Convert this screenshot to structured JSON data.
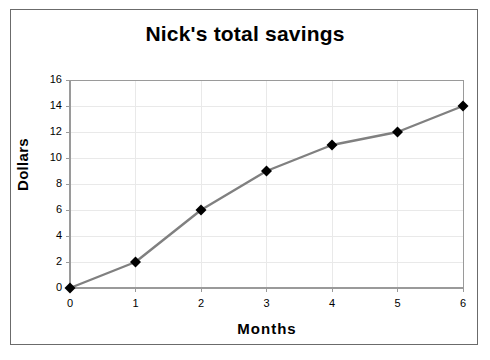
{
  "chart_data": {
    "type": "line",
    "title": "Nick's total savings",
    "xlabel": "Months",
    "ylabel": "Dollars",
    "x": [
      0,
      1,
      2,
      3,
      4,
      5,
      6
    ],
    "values": [
      0,
      2,
      6,
      9,
      11,
      12,
      14
    ],
    "series": [
      {
        "name": "Nick's total savings",
        "values": [
          0,
          2,
          6,
          9,
          11,
          12,
          14
        ]
      }
    ],
    "xlim": [
      0,
      6
    ],
    "ylim": [
      0,
      16
    ],
    "xticks": [
      "0",
      "1",
      "2",
      "3",
      "4",
      "5",
      "6"
    ],
    "yticks": [
      "0",
      "2",
      "4",
      "6",
      "8",
      "10",
      "12",
      "14",
      "16"
    ],
    "xtick_step": 1,
    "ytick_step": 2,
    "grid": true,
    "legend": false,
    "legend_position": "none",
    "line_color": "#808080",
    "marker_color": "#000000",
    "marker_shape": "diamond",
    "grid_color": "#e9e9e9",
    "axis_color": "#9a9a9a",
    "border_color": "#6b6b6b",
    "background": "#ffffff",
    "text_color": "#000000"
  }
}
